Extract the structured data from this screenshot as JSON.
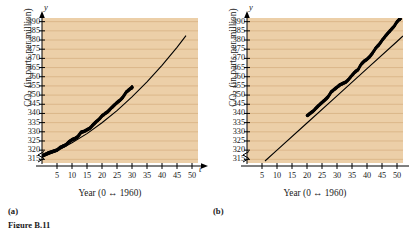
{
  "figure": {
    "caption": "Figure B.11",
    "panels": [
      {
        "tag": "(a)",
        "label_a": "(a)"
      },
      {
        "tag": "(b)",
        "label_b": "(b)"
      }
    ]
  },
  "labels": {
    "y_axis_title_main": "CO",
    "y_axis_title_sub": "2",
    "y_axis_title_rest": " (in parts per million)",
    "x_axis_title": "Year (0 ↔ 1960)",
    "y_axis_symbol": "y",
    "x_axis_symbol": "t",
    "panel_a_tag": "(a)",
    "panel_b_tag": "(b)",
    "figure_caption": "Figure B.11"
  },
  "colors": {
    "plot_background": "#eccfa8",
    "gridline": "#d7b183",
    "data": "#000000",
    "axis": "#000000",
    "page_background": "#ffffff"
  },
  "chart_data": [
    {
      "type": "scatter",
      "id": "panel-a",
      "title": "(a)",
      "xlabel": "Year (0 ↔ 1960)",
      "ylabel": "CO2 (in parts per million)",
      "xlim": [
        0,
        52
      ],
      "ylim": [
        313,
        392
      ],
      "xticks": [
        5,
        10,
        15,
        20,
        25,
        30,
        35,
        40,
        45,
        50
      ],
      "yticks": [
        315,
        320,
        325,
        330,
        335,
        340,
        345,
        350,
        355,
        360,
        365,
        370,
        375,
        380,
        385,
        390
      ],
      "grid": "horizontal",
      "axis_break_y": true,
      "legend": "none",
      "series": [
        {
          "name": "CO2 concentration (observed)",
          "kind": "scatter",
          "x": [
            0,
            1,
            2,
            3,
            4,
            5,
            6,
            7,
            8,
            9,
            10,
            11,
            12,
            13,
            14,
            15,
            16,
            17,
            18,
            19,
            20,
            21,
            22,
            23,
            24,
            25,
            26,
            27,
            28,
            29,
            30
          ],
          "y": [
            316.9,
            317.6,
            318.4,
            318.9,
            319.5,
            320.0,
            321.4,
            322.2,
            322.9,
            324.6,
            325.7,
            326.3,
            327.5,
            329.7,
            330.2,
            331.1,
            332.0,
            333.8,
            335.4,
            336.8,
            338.7,
            339.9,
            341.1,
            342.8,
            344.4,
            345.9,
            347.2,
            348.9,
            351.5,
            352.9,
            354.2
          ]
        },
        {
          "name": "Quadratic model",
          "kind": "line",
          "x": [
            0,
            5,
            10,
            15,
            20,
            25,
            30,
            35,
            40,
            45,
            48
          ],
          "y": [
            316.2,
            319.6,
            324.0,
            329.0,
            334.9,
            341.5,
            349.0,
            357.2,
            366.2,
            376.0,
            382.4
          ]
        }
      ]
    },
    {
      "type": "scatter",
      "id": "panel-b",
      "title": "(b)",
      "xlabel": "Year (0 ↔ 1960)",
      "ylabel": "CO2 (in parts per million)",
      "xlim": [
        0,
        52
      ],
      "ylim": [
        313,
        392
      ],
      "xticks": [
        5,
        10,
        15,
        20,
        25,
        30,
        35,
        40,
        45,
        50
      ],
      "yticks": [
        315,
        320,
        325,
        330,
        335,
        340,
        345,
        350,
        355,
        360,
        365,
        370,
        375,
        380,
        385,
        390
      ],
      "grid": "horizontal",
      "axis_break_y": true,
      "legend": "none",
      "series": [
        {
          "name": "CO2 concentration (observed)",
          "kind": "scatter",
          "x": [
            20,
            21,
            22,
            23,
            24,
            25,
            26,
            27,
            28,
            29,
            30,
            31,
            32,
            33,
            34,
            35,
            36,
            37,
            38,
            39,
            40,
            41,
            42,
            43,
            44,
            45,
            46,
            47,
            48,
            49,
            50,
            51
          ],
          "y": [
            338.7,
            340.0,
            341.2,
            342.9,
            344.5,
            346.0,
            347.4,
            349.0,
            351.6,
            353.0,
            354.3,
            355.6,
            356.4,
            357.1,
            358.8,
            360.8,
            362.6,
            363.8,
            366.7,
            368.4,
            369.5,
            371.1,
            373.3,
            375.8,
            377.5,
            379.8,
            381.9,
            383.8,
            385.6,
            387.4,
            389.9,
            391.6
          ]
        },
        {
          "name": "Linear model",
          "kind": "line",
          "x": [
            6,
            10,
            20,
            30,
            40,
            50,
            52
          ],
          "y": [
            314.1,
            320.0,
            334.8,
            349.6,
            364.4,
            379.2,
            382.2
          ]
        }
      ]
    }
  ]
}
